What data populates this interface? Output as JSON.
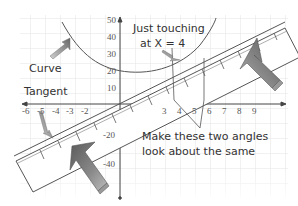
{
  "diagram": {
    "labels": {
      "curve": "Curve",
      "tangent": "Tangent",
      "just_touching_line1": "Just touching",
      "just_touching_line2": "at X = 4",
      "angles_line1": "Make these two angles",
      "angles_line2": "look about the same"
    },
    "y_axis_ticks": [
      "50",
      "40",
      "30",
      "20",
      "10",
      "-20",
      "-40"
    ],
    "x_axis_ticks": [
      "-6",
      "-5",
      "-4",
      "-3",
      "-2",
      "3",
      "4",
      "5",
      "6",
      "7",
      "8",
      "9"
    ],
    "colors": {
      "grid": "#e2e2e2",
      "axis": "#444444",
      "curve": "#555555",
      "ruler_fill": "#ffffff",
      "ruler_edge": "#555555",
      "arrow_dark": "#6a6a6a",
      "arrow_light": "#c8c8c8",
      "text": "#333333"
    }
  }
}
